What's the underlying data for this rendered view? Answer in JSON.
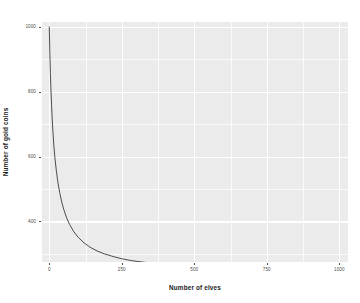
{
  "chart_data": {
    "type": "line",
    "title": "",
    "subtitle": "",
    "xlabel": "Number of elves",
    "ylabel": "Number of gold coins",
    "xlim": [
      -25,
      1030
    ],
    "ylim": [
      275,
      1015
    ],
    "xticks": [
      0,
      250,
      500,
      750,
      1000
    ],
    "xtick_labels": [
      "0",
      "250",
      "500",
      "750",
      "1000"
    ],
    "yticks": [
      400,
      600,
      800,
      1000
    ],
    "ytick_labels": [
      "400",
      "600",
      "800",
      "1000"
    ],
    "grid": true,
    "grid_major_color": "#ffffff",
    "grid_minor_color": "#ffffff",
    "panel_background": "#ebebeb",
    "legend": "none",
    "series": [
      {
        "name": "gold coins per elf",
        "color": "#3a3a3a",
        "line_width": 0.9,
        "x": [
          0,
          2,
          4,
          6,
          8,
          10,
          13,
          16,
          20,
          25,
          30,
          36,
          43,
          50,
          60,
          70,
          85,
          100,
          120,
          140,
          165,
          190,
          220,
          250,
          285,
          320,
          360,
          400,
          450,
          500,
          550,
          600,
          660,
          720,
          780,
          850,
          920,
          1000
        ],
        "y": [
          1000,
          920,
          856,
          803,
          758,
          720,
          672,
          633,
          592,
          552,
          520,
          489,
          460,
          437,
          411,
          391,
          368,
          351,
          334,
          321,
          309,
          300,
          292,
          285,
          279,
          275,
          271,
          268,
          264,
          261,
          259,
          257,
          255,
          253,
          252,
          250,
          249,
          248
        ]
      }
    ]
  },
  "axis": {
    "x_tick_positions_px": [
      52,
      124,
      196,
      269,
      341
    ],
    "y_tick_positions_px": [
      212,
      150,
      88,
      27
    ]
  }
}
